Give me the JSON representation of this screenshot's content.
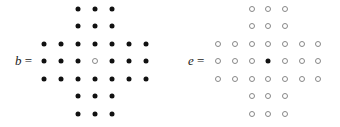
{
  "boards": [
    {
      "name": "b",
      "label_var": "b",
      "label_eq": " =",
      "label_pos": [
        15,
        54
      ],
      "col_x": [
        44,
        61,
        78,
        95,
        112,
        129,
        146
      ],
      "row_y": [
        9,
        26,
        44,
        61,
        79,
        96,
        114
      ],
      "grid": [
        "..XXX..",
        "..XXX..",
        "XXXXXXX",
        "XXXOXXX",
        "XXXXXXX",
        "..XXX..",
        "..XXX.."
      ]
    },
    {
      "name": "e",
      "label_var": "e",
      "label_eq": " =",
      "label_pos": [
        188,
        54
      ],
      "col_x": [
        218,
        235,
        252,
        268,
        285,
        302,
        318
      ],
      "row_y": [
        9,
        26,
        44,
        61,
        79,
        96,
        114
      ],
      "grid": [
        "..OOO..",
        "..OOO..",
        "OOOOOOO",
        "OOOXOOO",
        "OOOOOOO",
        "..OOO..",
        "..OOO.."
      ]
    }
  ],
  "legend": {
    "filled": "peg",
    "empty": "hole"
  }
}
